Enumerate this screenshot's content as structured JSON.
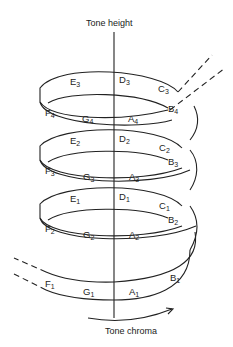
{
  "diagram": {
    "axes": {
      "vertical_label": "Tone height",
      "horizontal_label": "Tone chroma"
    },
    "turns": [
      {
        "level": 1,
        "notes": [
          {
            "name": "F",
            "octave": "1"
          },
          {
            "name": "G",
            "octave": "1"
          },
          {
            "name": "A",
            "octave": "1"
          },
          {
            "name": "B",
            "octave": "1"
          }
        ]
      },
      {
        "level": 2,
        "notes": [
          {
            "name": "C",
            "octave": "1"
          },
          {
            "name": "D",
            "octave": "1"
          },
          {
            "name": "E",
            "octave": "1"
          },
          {
            "name": "F",
            "octave": "2"
          },
          {
            "name": "G",
            "octave": "2"
          },
          {
            "name": "A",
            "octave": "2"
          },
          {
            "name": "B",
            "octave": "2"
          }
        ]
      },
      {
        "level": 3,
        "notes": [
          {
            "name": "C",
            "octave": "2"
          },
          {
            "name": "D",
            "octave": "2"
          },
          {
            "name": "E",
            "octave": "2"
          },
          {
            "name": "F",
            "octave": "3"
          },
          {
            "name": "G",
            "octave": "3"
          },
          {
            "name": "A",
            "octave": "3"
          },
          {
            "name": "B",
            "octave": "3"
          }
        ]
      },
      {
        "level": 4,
        "notes": [
          {
            "name": "C",
            "octave": "3"
          },
          {
            "name": "D",
            "octave": "3"
          },
          {
            "name": "E",
            "octave": "3"
          },
          {
            "name": "F",
            "octave": "4"
          },
          {
            "name": "G",
            "octave": "4"
          },
          {
            "name": "A",
            "octave": "4"
          },
          {
            "name": "B",
            "octave": "4"
          }
        ]
      }
    ],
    "labels": {
      "E3": {
        "n": "E",
        "s": "3"
      },
      "D3": {
        "n": "D",
        "s": "3"
      },
      "C3": {
        "n": "C",
        "s": "3"
      },
      "B4": {
        "n": "B",
        "s": "4"
      },
      "F4": {
        "n": "F",
        "s": "4"
      },
      "G4": {
        "n": "G",
        "s": "4"
      },
      "A4": {
        "n": "A",
        "s": "4"
      },
      "E2": {
        "n": "E",
        "s": "2"
      },
      "D2": {
        "n": "D",
        "s": "2"
      },
      "C2": {
        "n": "C",
        "s": "2"
      },
      "B3": {
        "n": "B",
        "s": "3"
      },
      "F3": {
        "n": "F",
        "s": "3"
      },
      "G3": {
        "n": "G",
        "s": "3"
      },
      "A3": {
        "n": "A",
        "s": "3"
      },
      "E1": {
        "n": "E",
        "s": "1"
      },
      "D1": {
        "n": "D",
        "s": "1"
      },
      "C1": {
        "n": "C",
        "s": "1"
      },
      "B2": {
        "n": "B",
        "s": "2"
      },
      "F2": {
        "n": "F",
        "s": "2"
      },
      "G2": {
        "n": "G",
        "s": "2"
      },
      "A2": {
        "n": "A",
        "s": "2"
      },
      "B1": {
        "n": "B",
        "s": "1"
      },
      "F1": {
        "n": "F",
        "s": "1"
      },
      "G1": {
        "n": "G",
        "s": "1"
      },
      "A1": {
        "n": "A",
        "s": "1"
      }
    }
  }
}
